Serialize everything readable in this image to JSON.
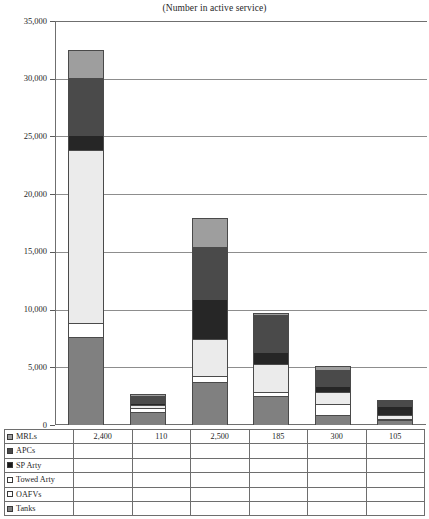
{
  "chart_data": {
    "type": "bar",
    "subtype": "stacked-column",
    "title": "(Number in active service)",
    "xlabel": "",
    "ylabel": "",
    "ylim": [
      0,
      35000
    ],
    "ytick_labels": [
      "35,000",
      "30,000",
      "25,000",
      "20,000",
      "15,000",
      "10,000",
      "5,000",
      "0"
    ],
    "ytick_values": [
      35000,
      30000,
      25000,
      20000,
      15000,
      10000,
      5000,
      0
    ],
    "grid": true,
    "legend_position": "table-left",
    "categories": [
      "C1",
      "C2",
      "C3",
      "C4",
      "C5",
      "C6"
    ],
    "series": [
      {
        "name": "Tanks",
        "color": "#808080",
        "values": [
          7600,
          1100,
          3700,
          2500,
          900,
          400
        ]
      },
      {
        "name": "OAFVs",
        "color": "#ffffff",
        "values": [
          1200,
          350,
          550,
          350,
          900,
          150
        ]
      },
      {
        "name": "Towed Arty",
        "color": "#ebebeb",
        "values": [
          15000,
          300,
          3200,
          2400,
          1100,
          300
        ]
      },
      {
        "name": "SP Arty",
        "color": "#262626",
        "values": [
          1300,
          150,
          3500,
          1100,
          500,
          800
        ]
      },
      {
        "name": "APCs",
        "color": "#4a4a4a",
        "values": [
          5000,
          650,
          4500,
          3200,
          1400,
          450
        ]
      },
      {
        "name": "MRLs",
        "color": "#9e9e9e",
        "values": [
          2400,
          110,
          2500,
          185,
          300,
          105
        ]
      }
    ]
  },
  "table": {
    "rows": [
      {
        "label": "MRLs",
        "swatch": "#9e9e9e",
        "marker": "filled",
        "values": [
          "2,400",
          "110",
          "2,500",
          "185",
          "300",
          "105"
        ]
      },
      {
        "label": "APCs",
        "swatch": "#4a4a4a",
        "marker": "filled",
        "values": [
          "",
          "",
          "",
          "",
          "",
          ""
        ]
      },
      {
        "label": "SP Arty",
        "swatch": "#1a1a1a",
        "marker": "filled",
        "values": [
          "",
          "",
          "",
          "",
          "",
          ""
        ]
      },
      {
        "label": "Towed Arty",
        "swatch": "#ffffff",
        "marker": "hollow",
        "values": [
          "",
          "",
          "",
          "",
          "",
          ""
        ]
      },
      {
        "label": "OAFVs",
        "swatch": "#ffffff",
        "marker": "hollow",
        "values": [
          "",
          "",
          "",
          "",
          "",
          ""
        ]
      },
      {
        "label": "Tanks",
        "swatch": "#808080",
        "marker": "filled",
        "values": [
          "",
          "",
          "",
          "",
          "",
          ""
        ]
      }
    ]
  }
}
